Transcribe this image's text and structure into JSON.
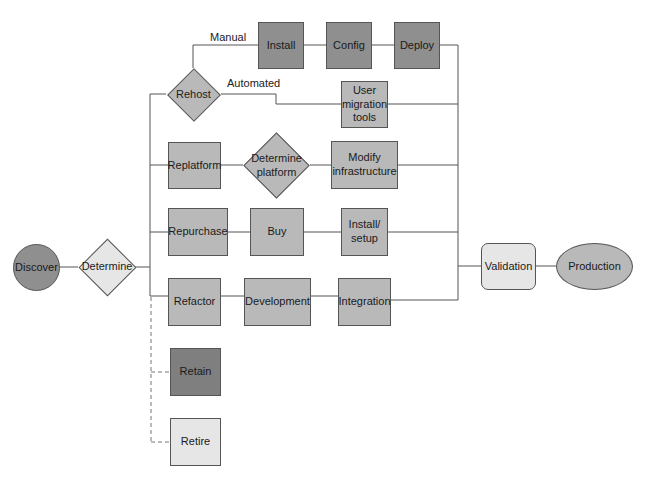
{
  "diagram": {
    "type": "flowchart",
    "title": "",
    "nodes": {
      "discover": "Discover",
      "determine": "Determine",
      "rehost": "Rehost",
      "install": "Install",
      "config": "Config",
      "deploy": "Deploy",
      "user_migration_tools": "User migration tools",
      "replatform": "Replatform",
      "determine_platform": "Determine platform",
      "modify_infrastructure": "Modify infrastructure",
      "repurchase": "Repurchase",
      "buy": "Buy",
      "install_setup": "Install/ setup",
      "refactor": "Refactor",
      "development": "Development",
      "integration": "Integration",
      "retain": "Retain",
      "retire": "Retire",
      "validation": "Validation",
      "production": "Production"
    },
    "edge_labels": {
      "manual": "Manual",
      "automated": "Automated"
    },
    "edges": [
      [
        "Discover",
        "Determine"
      ],
      [
        "Determine",
        "Rehost"
      ],
      [
        "Determine",
        "Replatform"
      ],
      [
        "Determine",
        "Repurchase"
      ],
      [
        "Determine",
        "Refactor"
      ],
      [
        "Determine",
        "Retain",
        "dashed"
      ],
      [
        "Determine",
        "Retire",
        "dashed"
      ],
      [
        "Rehost",
        "Install",
        "Manual"
      ],
      [
        "Install",
        "Config"
      ],
      [
        "Config",
        "Deploy"
      ],
      [
        "Rehost",
        "User migration tools",
        "Automated"
      ],
      [
        "Replatform",
        "Determine platform"
      ],
      [
        "Determine platform",
        "Modify infrastructure"
      ],
      [
        "Repurchase",
        "Buy"
      ],
      [
        "Buy",
        "Install/ setup"
      ],
      [
        "Refactor",
        "Development"
      ],
      [
        "Development",
        "Integration"
      ],
      [
        "Deploy",
        "Validation"
      ],
      [
        "User migration tools",
        "Validation"
      ],
      [
        "Modify infrastructure",
        "Validation"
      ],
      [
        "Install/ setup",
        "Validation"
      ],
      [
        "Integration",
        "Validation"
      ],
      [
        "Validation",
        "Production"
      ]
    ],
    "colors": {
      "dark": "#8f8f8f",
      "mid": "#b9b9b9",
      "light": "#e6e6e6",
      "stroke": "#555555"
    }
  }
}
